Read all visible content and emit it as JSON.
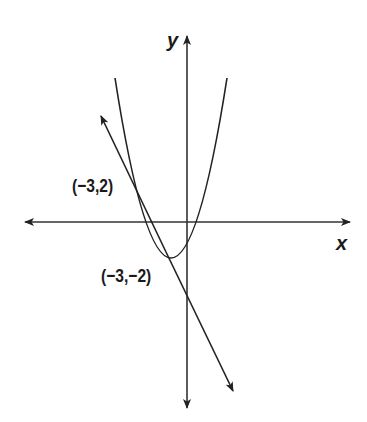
{
  "diagram": {
    "type": "coordinate-graph",
    "axes": {
      "x_label": "x",
      "y_label": "y",
      "arrows": "both-ends"
    },
    "curves": [
      {
        "name": "parabola",
        "shape": "upward-opening parabola",
        "vertex_position": "below x-axis, left of y-axis"
      },
      {
        "name": "line",
        "shape": "straight line with arrows at both ends",
        "slope": "negative"
      }
    ],
    "points": [
      {
        "label": "(−3,2)"
      },
      {
        "label": "(−3,−2)"
      }
    ],
    "colors": {
      "stroke": "#222222",
      "background": "#ffffff"
    }
  }
}
